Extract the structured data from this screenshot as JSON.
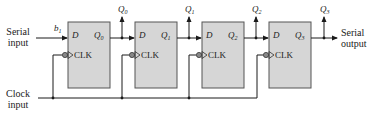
{
  "diagram": {
    "type": "serial-in serial-out shift register",
    "colors": {
      "box_fill": "#d6d6d6",
      "box_stroke": "#555555",
      "wire": "#1a1a1a",
      "text": "#222222"
    },
    "input": {
      "label_line1": "Serial",
      "label_line2": "input",
      "data_label": "b",
      "data_subscript": "1"
    },
    "clock": {
      "label_line1": "Clock",
      "label_line2": "input"
    },
    "output": {
      "label_line1": "Serial",
      "label_line2": "output"
    },
    "flipflops": [
      {
        "d_label": "D",
        "q_label": "Q",
        "q_sub": "0",
        "clk_label": "CLK",
        "tap_label": "Q",
        "tap_sub": "0"
      },
      {
        "d_label": "D",
        "q_label": "Q",
        "q_sub": "1",
        "clk_label": "CLK",
        "tap_label": "Q",
        "tap_sub": "1"
      },
      {
        "d_label": "D",
        "q_label": "Q",
        "q_sub": "2",
        "clk_label": "CLK",
        "tap_label": "Q",
        "tap_sub": "2"
      },
      {
        "d_label": "D",
        "q_label": "Q",
        "q_sub": "3",
        "clk_label": "CLK",
        "tap_label": "Q",
        "tap_sub": "3"
      }
    ]
  }
}
